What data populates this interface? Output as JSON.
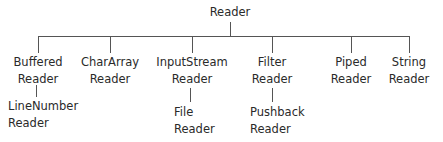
{
  "diagram": {
    "type": "class-hierarchy-tree",
    "root": {
      "line1": "Reader"
    },
    "children": [
      {
        "id": "buffered",
        "line1": "Buffered",
        "line2": "Reader",
        "child": {
          "line1": "LineNumber",
          "line2": "Reader"
        }
      },
      {
        "id": "chararray",
        "line1": "CharArray",
        "line2": "Reader"
      },
      {
        "id": "inputstream",
        "line1": "InputStream",
        "line2": "Reader",
        "child": {
          "line1": "File",
          "line2": "Reader"
        }
      },
      {
        "id": "filter",
        "line1": "Filter",
        "line2": "Reader",
        "child": {
          "line1": "Pushback",
          "line2": "Reader"
        }
      },
      {
        "id": "piped",
        "line1": "Piped",
        "line2": "Reader"
      },
      {
        "id": "string",
        "line1": "String",
        "line2": "Reader"
      }
    ],
    "line_color": "#555555",
    "text_color": "#2a2a2a"
  }
}
